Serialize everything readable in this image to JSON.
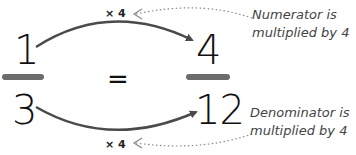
{
  "equation": {
    "left": {
      "numerator": "1",
      "denominator": "3"
    },
    "equals": "=",
    "right": {
      "numerator": "4",
      "denominator": "12"
    }
  },
  "multipliers": {
    "top": "× 4",
    "bottom": "× 4"
  },
  "annotations": {
    "top": [
      "Numerator is",
      "multiplied by 4"
    ],
    "bottom": [
      "Denominator is",
      "multiplied by 4"
    ]
  },
  "colors": {
    "arrow": "#4a4a4a",
    "fraction_bar": "#6b6b6b",
    "dotted_leader": "#888888",
    "text": "#111111",
    "annotation_text": "#444444"
  }
}
